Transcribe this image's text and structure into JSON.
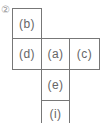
{
  "diagram": {
    "label": "②",
    "cells": [
      {
        "id": "b",
        "text": "(b)"
      },
      {
        "id": "d",
        "text": "(d)"
      },
      {
        "id": "a",
        "text": "(a)"
      },
      {
        "id": "c",
        "text": "(c)"
      },
      {
        "id": "e",
        "text": "(e)"
      },
      {
        "id": "i",
        "text": "(i)"
      }
    ],
    "colors": {
      "border": "#777777",
      "text": "#666666",
      "label": "#9a9a9a"
    }
  }
}
